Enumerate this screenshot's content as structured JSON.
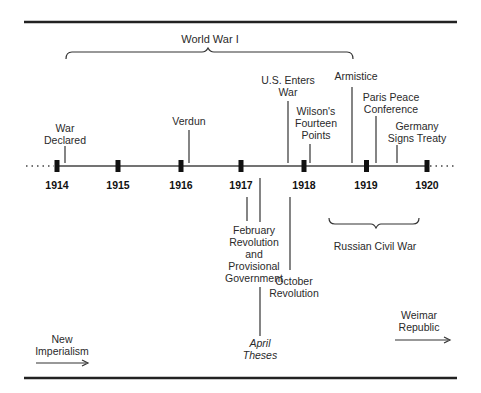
{
  "title_bracket": {
    "label": "World War I"
  },
  "timeline": {
    "years": [
      "1914",
      "1915",
      "1916",
      "1917",
      "1918",
      "1919",
      "1920"
    ]
  },
  "events_above": [
    {
      "id": "war-declared",
      "lines": [
        "War",
        "Declared"
      ]
    },
    {
      "id": "verdun",
      "lines": [
        "Verdun"
      ]
    },
    {
      "id": "us-enters-war",
      "lines": [
        "U.S. Enters",
        "War"
      ]
    },
    {
      "id": "wilsons-fourteen-points",
      "lines": [
        "Wilson's",
        "Fourteen",
        "Points"
      ]
    },
    {
      "id": "armistice",
      "lines": [
        "Armistice"
      ]
    },
    {
      "id": "paris-peace-conference",
      "lines": [
        "Paris Peace",
        "Conference"
      ]
    },
    {
      "id": "germany-signs-treaty",
      "lines": [
        "Germany",
        "Signs Treaty"
      ]
    }
  ],
  "events_below": [
    {
      "id": "february-revolution",
      "lines": [
        "February",
        "Revolution",
        "and",
        "Provisional",
        "Government"
      ]
    },
    {
      "id": "october-revolution",
      "lines": [
        "October",
        "Revolution"
      ]
    },
    {
      "id": "april-theses",
      "lines": [
        "April",
        "Theses"
      ]
    }
  ],
  "russian_civil_war": {
    "label": "Russian Civil War"
  },
  "eras": {
    "before": {
      "lines": [
        "New",
        "Imperialism"
      ]
    },
    "after": {
      "lines": [
        "Weimar",
        "Republic"
      ]
    }
  }
}
